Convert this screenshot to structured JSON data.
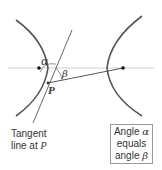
{
  "diagram": {
    "type": "hyperbola-reflection-property",
    "labels": {
      "alpha": "α",
      "beta": "β",
      "point": "P"
    },
    "tangent_label": {
      "line1": "Tangent",
      "line2_prefix": "line at ",
      "line2_var": "P"
    },
    "info_box": {
      "line1_prefix": "Angle ",
      "line1_var": "α",
      "line2": "equals",
      "line3_prefix": "angle ",
      "line3_var": "β"
    },
    "colors": {
      "curve": "#555555",
      "axis": "#bbbbbb",
      "line": "#444444",
      "text": "#333333"
    }
  }
}
